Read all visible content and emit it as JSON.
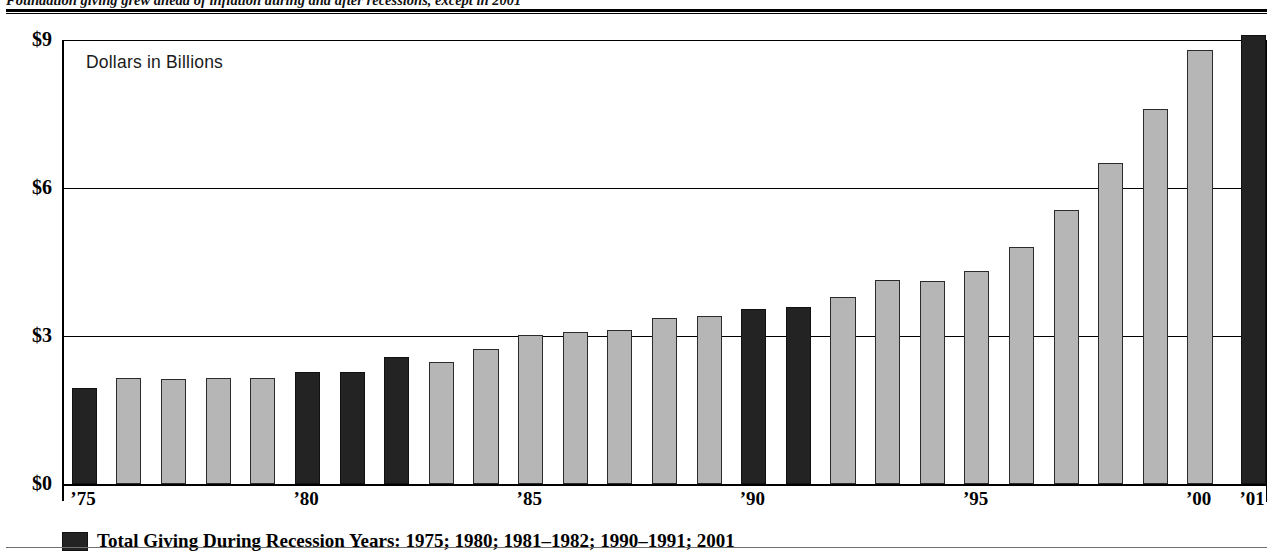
{
  "caption": {
    "headline": "Foundation giving grew ahead of inflation during and after recessions, except in 2001"
  },
  "chart_data": {
    "type": "bar",
    "title": "",
    "subtitle": "",
    "annotation": "Dollars in Billions",
    "xlabel": "",
    "ylabel": "",
    "ylim": [
      0,
      9
    ],
    "yticks": [
      0,
      3,
      6,
      9
    ],
    "ytick_labels": [
      "$0",
      "$3",
      "$6",
      "$9"
    ],
    "grid": true,
    "legend_position": "below-axis",
    "categories": [
      "1975",
      "1976",
      "1977",
      "1978",
      "1979",
      "1980",
      "1981",
      "1982",
      "1983",
      "1984",
      "1985",
      "1986",
      "1987",
      "1988",
      "1989",
      "1990",
      "1991",
      "1992",
      "1993",
      "1994",
      "1995",
      "1996",
      "1997",
      "1998",
      "1999",
      "2000",
      "2001"
    ],
    "xtick_labels": [
      {
        "category": "1975",
        "label": "’75"
      },
      {
        "category": "1980",
        "label": "’80"
      },
      {
        "category": "1985",
        "label": "’85"
      },
      {
        "category": "1990",
        "label": "’90"
      },
      {
        "category": "1995",
        "label": "’95"
      },
      {
        "category": "2000",
        "label": "’00"
      },
      {
        "category": "2001",
        "label": "’01"
      }
    ],
    "values": [
      1.94,
      2.15,
      2.13,
      2.15,
      2.15,
      2.28,
      2.28,
      2.58,
      2.47,
      2.73,
      3.03,
      3.09,
      3.13,
      3.36,
      3.4,
      3.55,
      3.58,
      3.8,
      4.13,
      4.12,
      4.32,
      4.8,
      5.55,
      6.5,
      7.6,
      8.8,
      9.1
    ],
    "series": [
      {
        "name": "Total Giving During Recession Years",
        "color": "#232323",
        "categories": [
          "1975",
          "1980",
          "1981",
          "1982",
          "1990",
          "1991",
          "2001"
        ]
      },
      {
        "name": "Total Giving",
        "color": "#b6b6b6",
        "categories": [
          "1976",
          "1977",
          "1978",
          "1979",
          "1983",
          "1984",
          "1985",
          "1986",
          "1987",
          "1988",
          "1989",
          "1992",
          "1993",
          "1994",
          "1995",
          "1996",
          "1997",
          "1998",
          "1999",
          "2000"
        ]
      }
    ],
    "legend": [
      {
        "swatch_color": "#232323",
        "label": "Total Giving During Recession Years: 1975; 1980; 1981–1982; 1990–1991; 2001"
      }
    ]
  }
}
